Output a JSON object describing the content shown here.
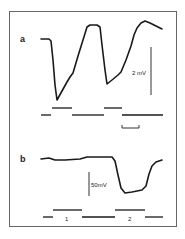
{
  "figure": {
    "panel_a_label": "a",
    "panel_b_label": "b",
    "scale_a_label": "2 mV",
    "scale_b_label": "50mV",
    "stim_label_1": "1",
    "stim_label_2": "2",
    "ink_color": "#1a1a1a",
    "frame_color": "#555555"
  },
  "chart_data": [
    {
      "type": "line",
      "panel": "a",
      "title": "",
      "xlabel": "",
      "ylabel": "",
      "scale_bar": "2 mV",
      "time_scale_bar": true,
      "trace_pixels": [
        [
          41,
          39
        ],
        [
          49,
          39
        ],
        [
          51,
          41
        ],
        [
          53,
          60
        ],
        [
          55,
          85
        ],
        [
          57,
          100
        ],
        [
          62,
          91
        ],
        [
          67,
          82
        ],
        [
          70,
          77
        ],
        [
          73,
          73
        ],
        [
          78,
          56
        ],
        [
          83,
          40
        ],
        [
          87,
          27
        ],
        [
          90,
          25
        ],
        [
          97,
          25
        ],
        [
          100,
          27
        ],
        [
          102,
          45
        ],
        [
          105,
          70
        ],
        [
          107,
          84
        ],
        [
          112,
          80
        ],
        [
          118,
          75
        ],
        [
          121,
          72
        ],
        [
          126,
          60
        ],
        [
          131,
          46
        ],
        [
          134,
          35
        ],
        [
          137,
          28
        ],
        [
          141,
          23
        ],
        [
          145,
          21
        ],
        [
          150,
          23
        ],
        [
          156,
          26
        ],
        [
          162,
          29
        ]
      ],
      "stimulus_bars": {
        "upper": [
          [
            52,
            72
          ],
          [
            104,
            122
          ]
        ],
        "lower": [
          [
            41,
            51
          ],
          [
            72,
            104
          ],
          [
            122,
            163
          ]
        ]
      }
    },
    {
      "type": "line",
      "panel": "b",
      "title": "",
      "xlabel": "",
      "ylabel": "",
      "scale_bar": "50mV",
      "trace_pixels": [
        [
          41,
          159
        ],
        [
          49,
          158
        ],
        [
          55,
          160
        ],
        [
          65,
          160
        ],
        [
          80,
          159
        ],
        [
          87,
          157
        ],
        [
          100,
          157
        ],
        [
          112,
          157
        ],
        [
          115,
          161
        ],
        [
          118,
          175
        ],
        [
          121,
          188
        ],
        [
          125,
          193
        ],
        [
          132,
          192
        ],
        [
          142,
          190
        ],
        [
          146,
          186
        ],
        [
          149,
          174
        ],
        [
          152,
          166
        ],
        [
          156,
          162
        ],
        [
          162,
          160
        ]
      ],
      "stimulus_bars": {
        "upper": [
          [
            53,
            82
          ],
          [
            115,
            145
          ]
        ],
        "lower": [
          [
            43,
            53
          ],
          [
            82,
            115
          ],
          [
            145,
            163
          ]
        ]
      },
      "stimulus_labels": [
        "1",
        "2"
      ]
    }
  ]
}
